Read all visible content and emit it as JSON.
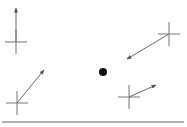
{
  "diagram": {
    "width": 187,
    "height": 127,
    "colors": {
      "background": "#ffffff",
      "cross": "#777777",
      "arrow": "#6a6a6a",
      "dot": "#111111",
      "baseline": "#666666"
    },
    "baseline": {
      "x1": 2,
      "y1": 122,
      "x2": 184,
      "y2": 122
    },
    "dot": {
      "cx": 103,
      "cy": 72,
      "r": 4
    },
    "markers": [
      {
        "id": "marker-1",
        "cx": 16,
        "cy": 42,
        "half_w": 11,
        "half_h": 12,
        "arrow": {
          "x2": 16,
          "y2": 8
        }
      },
      {
        "id": "marker-2",
        "cx": 17,
        "cy": 103,
        "half_w": 11,
        "half_h": 12,
        "arrow": {
          "x2": 44,
          "y2": 70
        }
      },
      {
        "id": "marker-3",
        "cx": 169,
        "cy": 34,
        "half_w": 11,
        "half_h": 12,
        "arrow": {
          "x2": 127,
          "y2": 59
        }
      },
      {
        "id": "marker-4",
        "cx": 129,
        "cy": 97,
        "half_w": 11,
        "half_h": 12,
        "arrow": {
          "x2": 156,
          "y2": 85
        }
      }
    ]
  }
}
